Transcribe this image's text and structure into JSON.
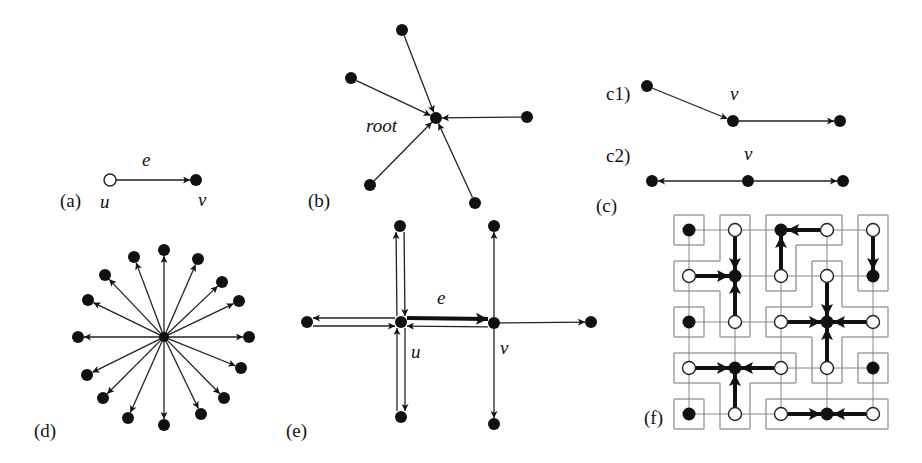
{
  "colors": {
    "ink": "#111111",
    "grid": "#888888",
    "box": "#999999",
    "background": "#ffffff"
  },
  "panels": {
    "a": {
      "label": "(a)",
      "label_pos": [
        60,
        207
      ],
      "edge_label": "e",
      "edge_label_pos": [
        142,
        166
      ],
      "u": {
        "label": "u",
        "pos": [
          110,
          180
        ],
        "fill": "open",
        "label_pos": [
          100,
          208
        ]
      },
      "v": {
        "label": "v",
        "pos": [
          196,
          180
        ],
        "fill": "filled",
        "label_pos": [
          198,
          206
        ]
      }
    },
    "b": {
      "label": "(b)",
      "label_pos": [
        308,
        207
      ],
      "root_label": "root",
      "root_label_pos": [
        366,
        132
      ],
      "root": [
        436,
        118
      ],
      "leaves": [
        [
          402,
          30
        ],
        [
          351,
          78
        ],
        [
          527,
          117
        ],
        [
          370,
          185
        ],
        [
          475,
          203
        ]
      ]
    },
    "c": {
      "label": "(c)",
      "label_pos": [
        596,
        212
      ],
      "c1": {
        "label": "c1)",
        "label_pos": [
          606,
          100
        ],
        "v_label": "v",
        "v_label_pos": [
          730,
          100
        ],
        "nodes": [
          [
            647,
            86
          ],
          [
            733,
            121
          ],
          [
            840,
            121
          ]
        ],
        "edges": [
          [
            0,
            1
          ],
          [
            1,
            2
          ]
        ]
      },
      "c2": {
        "label": "c2)",
        "label_pos": [
          606,
          162
        ],
        "v_label": "v",
        "v_label_pos": [
          744,
          160
        ],
        "nodes": [
          [
            652,
            181
          ],
          [
            748,
            181
          ],
          [
            843,
            181
          ]
        ],
        "edges": [
          [
            1,
            0
          ],
          [
            1,
            2
          ]
        ]
      }
    },
    "d": {
      "label": "(d)",
      "label_pos": [
        34,
        437
      ],
      "center": [
        164,
        337
      ],
      "leaves": [
        [
          164,
          250
        ],
        [
          198,
          259
        ],
        [
          222,
          282
        ],
        [
          239,
          301
        ],
        [
          249,
          337
        ],
        [
          241,
          368
        ],
        [
          224,
          398
        ],
        [
          201,
          414
        ],
        [
          164,
          425
        ],
        [
          128,
          418
        ],
        [
          103,
          398
        ],
        [
          87,
          375
        ],
        [
          78,
          337
        ],
        [
          88,
          300
        ],
        [
          105,
          275
        ],
        [
          134,
          257
        ]
      ]
    },
    "e": {
      "label": "(e)",
      "label_pos": [
        286,
        437
      ],
      "edge_label": "e",
      "edge_label_pos": [
        437,
        304
      ],
      "u_label": "u",
      "u_label_pos": [
        411,
        358
      ],
      "v_label": "v",
      "v_label_pos": [
        500,
        354
      ],
      "u": [
        401,
        322
      ],
      "v": [
        494,
        323
      ],
      "left": [
        307,
        322
      ],
      "right": [
        591,
        322
      ],
      "top_left": [
        400,
        226
      ],
      "bottom_left": [
        401,
        417
      ],
      "top_right": [
        494,
        226
      ],
      "bottom_right": [
        494,
        424
      ]
    },
    "f": {
      "label": "(f)",
      "label_pos": [
        644,
        424
      ],
      "cols": [
        689,
        735,
        781,
        827,
        873
      ],
      "rows": [
        230,
        276,
        322,
        368,
        414
      ],
      "fills": [
        [
          "F",
          "O",
          "F",
          "O",
          "O"
        ],
        [
          "O",
          "F",
          "O",
          "O",
          "F"
        ],
        [
          "F",
          "O",
          "O",
          "F",
          "O"
        ],
        [
          "O",
          "F",
          "O",
          "O",
          "F"
        ],
        [
          "F",
          "O",
          "O",
          "F",
          "O"
        ]
      ],
      "arrows": [
        [
          [
            0,
            1
          ],
          [
            1,
            1
          ]
        ],
        [
          [
            1,
            0
          ],
          [
            1,
            1
          ]
        ],
        [
          [
            2,
            1
          ],
          [
            1,
            1
          ]
        ],
        [
          [
            0,
            3
          ],
          [
            0,
            2
          ]
        ],
        [
          [
            1,
            2
          ],
          [
            0,
            2
          ]
        ],
        [
          [
            0,
            4
          ],
          [
            1,
            4
          ]
        ],
        [
          [
            1,
            3
          ],
          [
            2,
            3
          ]
        ],
        [
          [
            2,
            2
          ],
          [
            2,
            3
          ]
        ],
        [
          [
            2,
            4
          ],
          [
            2,
            3
          ]
        ],
        [
          [
            3,
            3
          ],
          [
            2,
            3
          ]
        ],
        [
          [
            3,
            0
          ],
          [
            3,
            1
          ]
        ],
        [
          [
            3,
            2
          ],
          [
            3,
            1
          ]
        ],
        [
          [
            4,
            1
          ],
          [
            3,
            1
          ]
        ],
        [
          [
            4,
            2
          ],
          [
            4,
            3
          ]
        ],
        [
          [
            4,
            4
          ],
          [
            4,
            3
          ]
        ]
      ],
      "clusters": [
        [
          [
            0,
            0
          ]
        ],
        [
          [
            0,
            1
          ],
          [
            1,
            0
          ],
          [
            1,
            1
          ],
          [
            2,
            1
          ]
        ],
        [
          [
            0,
            2
          ],
          [
            0,
            3
          ],
          [
            1,
            2
          ]
        ],
        [
          [
            0,
            4
          ],
          [
            1,
            4
          ]
        ],
        [
          [
            2,
            0
          ]
        ],
        [
          [
            1,
            3
          ],
          [
            2,
            2
          ],
          [
            2,
            3
          ],
          [
            2,
            4
          ],
          [
            3,
            3
          ]
        ],
        [
          [
            3,
            0
          ],
          [
            3,
            1
          ],
          [
            3,
            2
          ],
          [
            4,
            1
          ]
        ],
        [
          [
            3,
            4
          ]
        ],
        [
          [
            4,
            0
          ]
        ],
        [
          [
            4,
            2
          ],
          [
            4,
            3
          ],
          [
            4,
            4
          ]
        ]
      ]
    }
  }
}
